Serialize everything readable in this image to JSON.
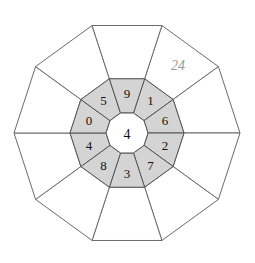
{
  "diagram": {
    "type": "polygon-rosette",
    "sides": 10,
    "geometry": {
      "center_x": 127,
      "center_y": 133,
      "outer_radius": 113,
      "inner_ring_outer_radius": 57,
      "inner_ring_inner_radius": 21,
      "rotation_deg": 18
    },
    "colors": {
      "background": "#ffffff",
      "outer_cell_fill": "#ffffff",
      "outer_cell_stroke": "#6b6b6b",
      "inner_cell_fill": "#d4d4d4",
      "inner_cell_stroke": "#555555",
      "core_fill": "#ffffff",
      "label_color": "#111111",
      "note_color": "#9a9a9a"
    },
    "core": {
      "label": "4"
    },
    "inner_ring_labels": [
      "1",
      "6",
      "2",
      "7",
      "3",
      "8",
      "4",
      "0",
      "5",
      "9"
    ],
    "outer_ring_labels": [
      "",
      "24",
      "",
      "",
      "",
      "",
      "",
      "",
      "",
      ""
    ],
    "annotation": {
      "text": "24",
      "x": 178,
      "y": 65
    }
  }
}
